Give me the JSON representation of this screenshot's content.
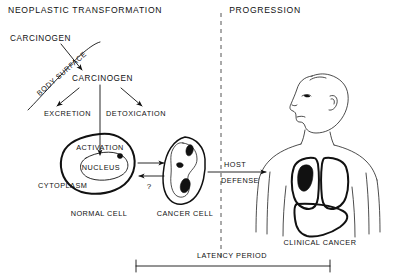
{
  "figure": {
    "title_left": "NEOPLASTIC TRANSFORMATION",
    "title_right": "PROGRESSION",
    "background_color": "#ffffff",
    "ink_color": "#111111",
    "divider_color": "#555555"
  },
  "labels": {
    "carcinogen_outside": "CARCINOGEN",
    "body_surface": "BODY SURFACE",
    "carcinogen_inside": "CARCINOGEN",
    "excretion": "EXCRETION",
    "detoxication": "DETOXICATION",
    "activation": "ACTIVATION",
    "nucleus": "NUCLEUS",
    "cytoplasm": "CYTOPLASM",
    "normal_cell": "NORMAL CELL",
    "cancer_cell": "CANCER CELL",
    "question_mark": "?",
    "host": "HOST",
    "defense": "DEFENSE",
    "clinical_cancer": "CLINICAL CANCER",
    "latency_period": "LATENCY PERIOD"
  },
  "icons": {
    "divider": "dashed-vertical-divider-icon",
    "body_surface_curve": "body-surface-curve-icon",
    "entry_arrow": "carcinogen-entry-arrow-icon",
    "excretion_arrow": "excretion-arrow-icon",
    "detoxication_arrow": "detoxication-arrow-icon",
    "activation_arrow": "activation-down-arrow-icon",
    "transform_arrow": "transformation-arrow-icon",
    "reverse_arrow": "reversion-arrow-icon",
    "host_defense_arrow": "host-defense-arrow-icon",
    "normal_cell": "normal-cell-icon",
    "nucleus": "nucleus-icon",
    "nucleolus": "nucleolus-icon",
    "cancer_cell": "cancer-cell-icon",
    "human_figure": "human-figure-profile-icon",
    "lung_left": "lung-icon",
    "lung_right": "lung-icon",
    "tumor": "lung-tumor-icon",
    "liver": "liver-icon",
    "latency_bar": "latency-period-bar-icon"
  }
}
